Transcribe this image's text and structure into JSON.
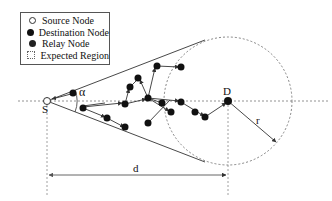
{
  "legend": {
    "items": [
      {
        "label": "Source Node",
        "icon": "hollow-circle"
      },
      {
        "label": "Destination Node",
        "icon": "filled-circle"
      },
      {
        "label": "Relay Node",
        "icon": "filled-circle"
      },
      {
        "label": "Expected Region",
        "icon": "dotted-square"
      }
    ]
  },
  "labels": {
    "source": "S",
    "destination": "D",
    "angle": "α",
    "distance": "d",
    "radius": "r"
  },
  "geometry": {
    "source": [
      47,
      101
    ],
    "destination": [
      228,
      101
    ],
    "radius_px": 64,
    "relay_nodes": [
      [
        73,
        93
      ],
      [
        83,
        108
      ],
      [
        107,
        87
      ],
      [
        107,
        118
      ],
      [
        125,
        104
      ],
      [
        130,
        87
      ],
      [
        138,
        78
      ],
      [
        148,
        98
      ],
      [
        150,
        123
      ],
      [
        157,
        66
      ],
      [
        171,
        113
      ],
      [
        181,
        67
      ],
      [
        180,
        102
      ],
      [
        191,
        114
      ],
      [
        205,
        117
      ],
      [
        172,
        112
      ]
    ]
  },
  "colors": {
    "line": "#333333",
    "dotted": "#777777",
    "node": "#111111"
  }
}
